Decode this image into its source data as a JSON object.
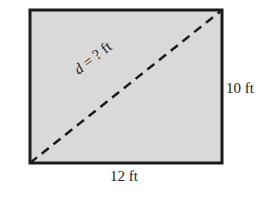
{
  "diagram": {
    "shape": "rectangle",
    "fill_color": "#d9d9d9",
    "stroke_color": "#1a1a1a",
    "width_label": "12 ft",
    "height_label": "10 ft",
    "diagonal": {
      "variable": "d",
      "rest": " = ? ft",
      "style": "dashed"
    }
  }
}
